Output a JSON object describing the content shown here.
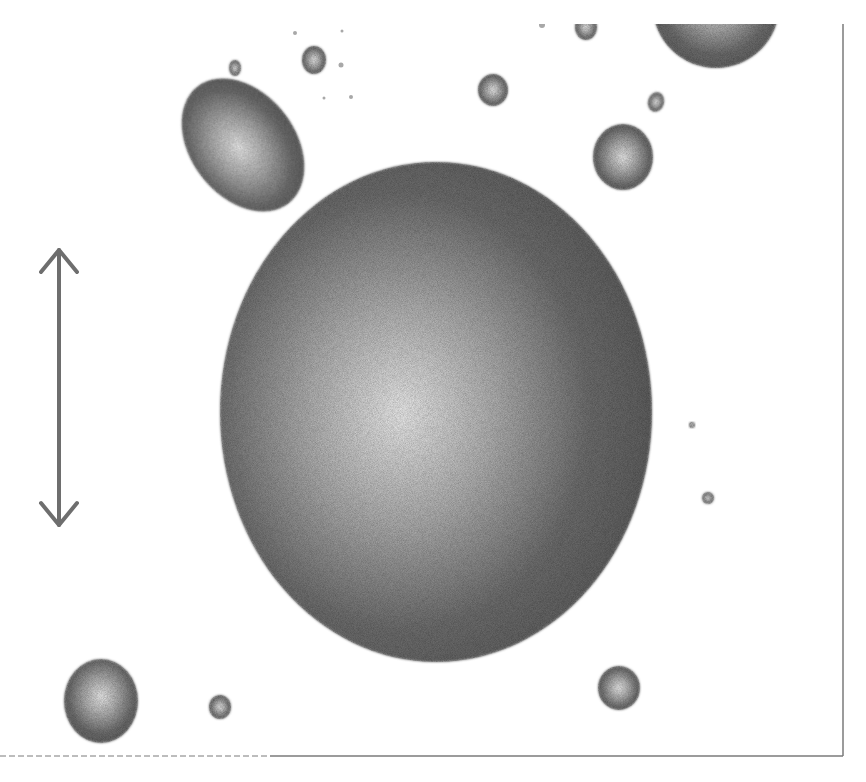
{
  "figure": {
    "caption": "Illustration of a large spherical particle surrounded by smaller particles, with a vertical double-headed scale arrow",
    "background": "#ffffff",
    "frame": {
      "color": "#7a7a7a",
      "right_x": 843,
      "bottom_y": 756,
      "top_y": 24
    },
    "particle_color_dark": "#5f5f5f",
    "particle_color_light": "#f2f2f2",
    "arrow": {
      "x": 59,
      "y1": 250,
      "y2": 525,
      "head_half_width": 18,
      "head_length": 22,
      "color": "#6e6e6e"
    },
    "particles": [
      {
        "id": "large-sphere",
        "cx": 436,
        "cy": 412,
        "rx": 216,
        "ry": 250,
        "hx": 0.42,
        "hy": 0.5,
        "rot": 0
      },
      {
        "id": "egg",
        "cx": 243,
        "cy": 145,
        "rx": 52,
        "ry": 74,
        "hx": 0.45,
        "hy": 0.5,
        "rot": -38
      },
      {
        "id": "top-right-half",
        "cx": 716,
        "cy": 6,
        "rx": 63,
        "ry": 62,
        "hx": 0.5,
        "hy": 0.45,
        "rot": 0
      },
      {
        "id": "right-medium",
        "cx": 623,
        "cy": 157,
        "rx": 30,
        "ry": 33,
        "hx": 0.5,
        "hy": 0.5,
        "rot": 0
      },
      {
        "id": "top-mid",
        "cx": 493,
        "cy": 90,
        "rx": 15,
        "ry": 16,
        "hx": 0.5,
        "hy": 0.5,
        "rot": 0
      },
      {
        "id": "top-small",
        "cx": 314,
        "cy": 60,
        "rx": 12,
        "ry": 14,
        "hx": 0.5,
        "hy": 0.5,
        "rot": 0
      },
      {
        "id": "top-cut",
        "cx": 586,
        "cy": 27,
        "rx": 11,
        "ry": 13,
        "hx": 0.5,
        "hy": 0.5,
        "rot": 0
      },
      {
        "id": "left-tiny",
        "cx": 235,
        "cy": 68,
        "rx": 6,
        "ry": 8,
        "hx": 0.5,
        "hy": 0.5,
        "rot": 0
      },
      {
        "id": "right-tiny-ellipse",
        "cx": 656,
        "cy": 102,
        "rx": 8,
        "ry": 10,
        "hx": 0.5,
        "hy": 0.5,
        "rot": 15
      },
      {
        "id": "bottom-left",
        "cx": 101,
        "cy": 701,
        "rx": 37,
        "ry": 42,
        "hx": 0.5,
        "hy": 0.45,
        "rot": 0
      },
      {
        "id": "bottom-small",
        "cx": 220,
        "cy": 707,
        "rx": 11,
        "ry": 12,
        "hx": 0.5,
        "hy": 0.5,
        "rot": 0
      },
      {
        "id": "bottom-right",
        "cx": 619,
        "cy": 688,
        "rx": 21,
        "ry": 22,
        "hx": 0.5,
        "hy": 0.5,
        "rot": 0
      },
      {
        "id": "speck-right-1",
        "cx": 692,
        "cy": 425,
        "rx": 3,
        "ry": 3,
        "hx": 0.5,
        "hy": 0.5,
        "rot": 0
      },
      {
        "id": "speck-right-2",
        "cx": 708,
        "cy": 498,
        "rx": 6,
        "ry": 6,
        "hx": 0.5,
        "hy": 0.5,
        "rot": 0
      }
    ],
    "specks": [
      {
        "cx": 295,
        "cy": 33,
        "r": 2
      },
      {
        "cx": 342,
        "cy": 31,
        "r": 1.5
      },
      {
        "cx": 341,
        "cy": 65,
        "r": 2.5
      },
      {
        "cx": 324,
        "cy": 98,
        "r": 1.5
      },
      {
        "cx": 351,
        "cy": 97,
        "r": 2
      },
      {
        "cx": 542,
        "cy": 25,
        "r": 3
      }
    ]
  }
}
